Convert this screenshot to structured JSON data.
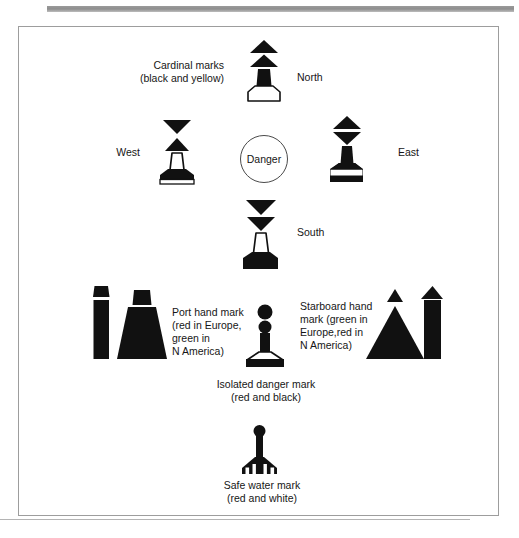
{
  "figure": {
    "bottom_caption": "",
    "colors": {
      "ink": "#111111",
      "frame": "#9d9d9d",
      "rule": "#9a9a9a",
      "paper": "#ffffff"
    }
  },
  "labels": {
    "cardinal_marks": "Cardinal marks\n(black and yellow)",
    "north": "North",
    "south": "South",
    "east": "East",
    "west": "West",
    "danger": "Danger",
    "port_hand": "Port hand mark\n(red in Europe,\ngreen in\nN America)",
    "starboard_hand": "Starboard hand\nmark (green in\nEurope,red in\nN America)",
    "isolated_danger": "Isolated danger mark\n(red and black)",
    "safe_water": "Safe water mark\n(red and white)"
  },
  "marks": [
    {
      "id": "north-cardinal-mark",
      "name": "North cardinal mark",
      "topmark": "two cones point up",
      "body": "black upper, yellow (white) lower",
      "label": "North"
    },
    {
      "id": "south-cardinal-mark",
      "name": "South cardinal mark",
      "topmark": "two cones point down",
      "body": "yellow (white) upper, black lower",
      "label": "South"
    },
    {
      "id": "east-cardinal-mark",
      "name": "East cardinal mark",
      "topmark": "two cones base to base",
      "body": "black with yellow band",
      "label": "East"
    },
    {
      "id": "west-cardinal-mark",
      "name": "West cardinal mark",
      "topmark": "two cones point to point",
      "body": "yellow with black band",
      "label": "West"
    },
    {
      "id": "port-hand-mark",
      "name": "Port hand mark",
      "topmark": "can",
      "body": "red in Europe, green in N America"
    },
    {
      "id": "starboard-hand-mark",
      "name": "Starboard hand mark",
      "topmark": "cone",
      "body": "green in Europe, red in N America"
    },
    {
      "id": "isolated-danger-mark",
      "name": "Isolated danger mark",
      "topmark": "two black spheres",
      "body": "red and black"
    },
    {
      "id": "safe-water-mark",
      "name": "Safe water mark",
      "topmark": "single sphere",
      "body": "red and white vertical stripes"
    }
  ]
}
